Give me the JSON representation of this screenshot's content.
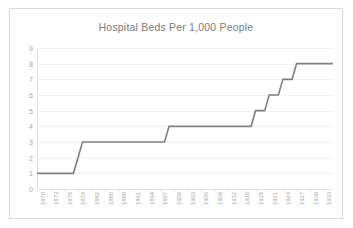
{
  "chart_data": {
    "type": "line",
    "title": "Hospital Beds Per 1,000 People",
    "xlabel": "",
    "ylabel": "",
    "ylim": [
      0,
      9
    ],
    "xlim": [
      1870,
      1935
    ],
    "grid": true,
    "legend": false,
    "step": true,
    "line_color": "#808080",
    "x": [
      1870,
      1871,
      1872,
      1873,
      1874,
      1875,
      1876,
      1877,
      1878,
      1879,
      1880,
      1881,
      1882,
      1883,
      1884,
      1885,
      1886,
      1887,
      1888,
      1889,
      1890,
      1891,
      1892,
      1893,
      1894,
      1895,
      1896,
      1897,
      1898,
      1899,
      1900,
      1901,
      1902,
      1903,
      1904,
      1905,
      1906,
      1907,
      1908,
      1909,
      1910,
      1911,
      1912,
      1913,
      1914,
      1915,
      1916,
      1917,
      1918,
      1919,
      1920,
      1921,
      1922,
      1923,
      1924,
      1925,
      1926,
      1927,
      1928,
      1929,
      1930,
      1931,
      1932,
      1933,
      1934,
      1935
    ],
    "values": [
      1,
      1,
      1,
      1,
      1,
      1,
      1,
      1,
      1,
      2,
      3,
      3,
      3,
      3,
      3,
      3,
      3,
      3,
      3,
      3,
      3,
      3,
      3,
      3,
      3,
      3,
      3,
      3,
      3,
      4,
      4,
      4,
      4,
      4,
      4,
      4,
      4,
      4,
      4,
      4,
      4,
      4,
      4,
      4,
      4,
      4,
      4,
      4,
      5,
      5,
      5,
      6,
      6,
      6,
      7,
      7,
      7,
      8,
      8,
      8,
      8,
      8,
      8,
      8,
      8,
      8
    ],
    "ytick_labels": [
      "9",
      "8",
      "7",
      "6",
      "5",
      "4",
      "3",
      "2",
      "1",
      "0"
    ],
    "ytick_values": [
      9,
      8,
      7,
      6,
      5,
      4,
      3,
      2,
      1,
      0
    ],
    "xtick_labels": [
      "1870",
      "1873",
      "1876",
      "1879",
      "1882",
      "1885",
      "1888",
      "1891",
      "1894",
      "1897",
      "1900",
      "1903",
      "1906",
      "1909",
      "1912",
      "1915",
      "1918",
      "1921",
      "1924",
      "1927",
      "1930",
      "1933"
    ],
    "xtick_values": [
      1870,
      1873,
      1876,
      1879,
      1882,
      1885,
      1888,
      1891,
      1894,
      1897,
      1900,
      1903,
      1906,
      1909,
      1912,
      1915,
      1918,
      1921,
      1924,
      1927,
      1930,
      1933
    ]
  },
  "colors": {
    "line": "#808080",
    "grid": "#f2f2f2",
    "border": "#d9d9d9",
    "text": "#a6a6a6",
    "title": "#7b7b7b",
    "background": "#ffffff"
  }
}
